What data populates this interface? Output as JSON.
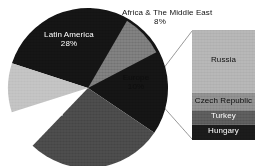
{
  "chart_data": {
    "type": "pie",
    "title": "",
    "subtitle": "",
    "xlabel": "",
    "ylabel": "",
    "grid": false,
    "legend_position": "none",
    "labels_on_slices": true,
    "categories": [
      "Asia",
      "Latin America",
      "Europe",
      "Africa & The Middle East"
    ],
    "values": [
      55,
      28,
      10,
      8
    ],
    "value_suffix": "%",
    "slices": [
      {
        "label": "Asia",
        "value": 55,
        "value_text": "55%",
        "color": "#141414",
        "text_color": "#ffffff"
      },
      {
        "label": "Latin America",
        "value": 28,
        "value_text": "28%",
        "color": "#4a4a4a",
        "text_color": "#ffffff"
      },
      {
        "label": "Africa & The Middle East",
        "value": 8,
        "value_text": "8%",
        "color": "#7b7b7b",
        "text_color": "#0d0d0d",
        "label_outside": true
      },
      {
        "label": "Europe",
        "value": 10,
        "value_text": "10%",
        "color": "#c2c2c2",
        "text_color": "#0d0d0d",
        "exploded_into_bar": true
      }
    ],
    "breakout": {
      "type": "stacked_bar",
      "source_slice": "Europe",
      "segments": [
        {
          "label": "Russia",
          "color": "#b4b4b4",
          "text_color": "#0d0d0d",
          "height_pct": 57
        },
        {
          "label": "Czech Republic",
          "color": "#8e8e8e",
          "text_color": "#0d0d0d",
          "height_pct": 16
        },
        {
          "label": "Turkey",
          "color": "#5b5b5b",
          "text_color": "#ffffff",
          "height_pct": 13
        },
        {
          "label": "Hungary",
          "color": "#1a1a1a",
          "text_color": "#ffffff",
          "height_pct": 14
        }
      ]
    }
  },
  "figure": {
    "background": "#ffffff",
    "leader_line_color": "#8c8c8c"
  }
}
